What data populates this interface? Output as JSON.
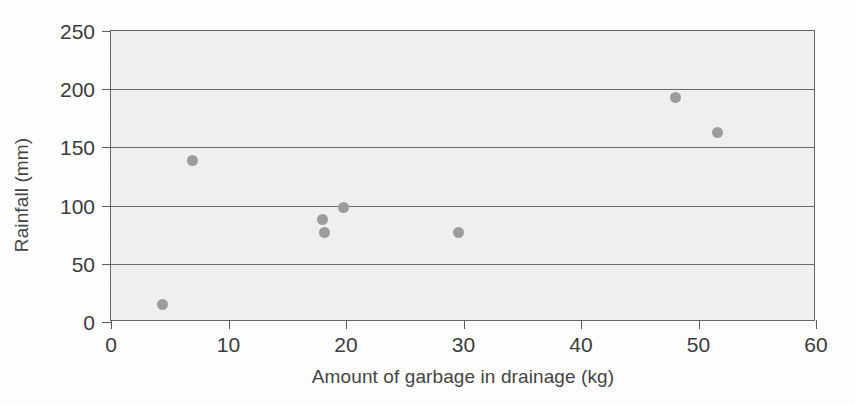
{
  "chart_data": {
    "type": "scatter",
    "title": "",
    "xlabel": "Amount of garbage in drainage (kg)",
    "ylabel": "Rainfall (mm)",
    "xlim": [
      0,
      60
    ],
    "ylim": [
      0,
      250
    ],
    "xticks": [
      0,
      10,
      20,
      30,
      40,
      50,
      60
    ],
    "yticks": [
      0,
      50,
      100,
      150,
      200,
      250
    ],
    "xtick_labels": [
      "0",
      "10",
      "20",
      "30",
      "40",
      "50",
      "60"
    ],
    "ytick_labels": [
      "0",
      "50",
      "100",
      "150",
      "200",
      "250"
    ],
    "grid": "horizontal",
    "legend": "none",
    "marker_color": "#9d9d9d",
    "plot_background": "#f1f1f1",
    "gridline_color": "#6a6a6a",
    "frame_color": "#676767",
    "points": [
      {
        "x": 4.4,
        "y": 15
      },
      {
        "x": 6.9,
        "y": 139
      },
      {
        "x": 18.0,
        "y": 88
      },
      {
        "x": 18.2,
        "y": 77
      },
      {
        "x": 19.8,
        "y": 98
      },
      {
        "x": 29.6,
        "y": 77
      },
      {
        "x": 48.0,
        "y": 193
      },
      {
        "x": 51.6,
        "y": 163
      }
    ]
  }
}
